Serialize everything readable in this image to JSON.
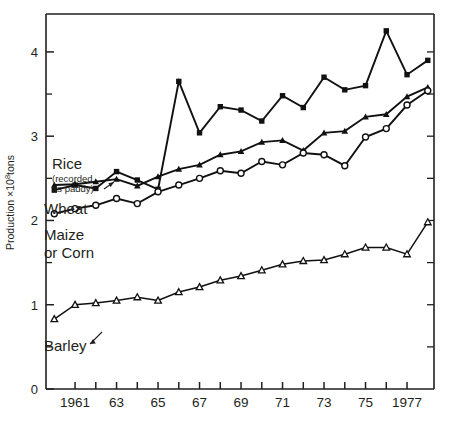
{
  "chart_data": {
    "type": "line",
    "title": "",
    "subtitle": "",
    "xlabel": "",
    "ylabel": "Production ×10⁸tons",
    "ylabel_parts": {
      "pre": "Production ×10",
      "sup": "8",
      "post": "tons"
    },
    "xlim": [
      1959.6,
      1978.3
    ],
    "ylim": [
      0,
      4.45
    ],
    "grid": false,
    "legend_position": "inline-annotations",
    "yticks_major": [
      0,
      1,
      2,
      3,
      4
    ],
    "yticks_major_labels": [
      "0",
      "1",
      "2",
      "3",
      "4"
    ],
    "yticks_minor": [
      0.5,
      1.5,
      2.5,
      3.5
    ],
    "xticks": [
      1961,
      1962,
      1963,
      1964,
      1965,
      1966,
      1967,
      1968,
      1969,
      1970,
      1971,
      1972,
      1973,
      1974,
      1975,
      1976,
      1977
    ],
    "xtick_labels": [
      {
        "x": 1961,
        "label": "1961"
      },
      {
        "x": 1963,
        "label": "63"
      },
      {
        "x": 1965,
        "label": "65"
      },
      {
        "x": 1967,
        "label": "67"
      },
      {
        "x": 1969,
        "label": "69"
      },
      {
        "x": 1971,
        "label": "71"
      },
      {
        "x": 1973,
        "label": "73"
      },
      {
        "x": 1975,
        "label": "75"
      },
      {
        "x": 1977,
        "label": "1977"
      }
    ],
    "x": [
      1960,
      1961,
      1962,
      1963,
      1964,
      1965,
      1966,
      1967,
      1968,
      1969,
      1970,
      1971,
      1972,
      1973,
      1974,
      1975,
      1976,
      1977,
      1978
    ],
    "series": [
      {
        "name": "Wheat",
        "marker": "filled-square",
        "values": [
          2.36,
          2.42,
          2.38,
          2.58,
          2.48,
          2.37,
          3.65,
          3.04,
          3.35,
          3.31,
          3.18,
          3.48,
          3.34,
          3.7,
          3.55,
          3.6,
          4.25,
          3.73,
          3.9
        ]
      },
      {
        "name": "Rice",
        "label": "Rice",
        "sublabel": "(recorded as paddy)",
        "marker": "filled-triangle",
        "values": [
          2.42,
          2.43,
          2.46,
          2.49,
          2.41,
          2.52,
          2.61,
          2.66,
          2.78,
          2.82,
          2.93,
          2.95,
          2.83,
          3.04,
          3.06,
          3.23,
          3.26,
          3.47,
          3.58
        ]
      },
      {
        "name": "Maize or Corn",
        "marker": "open-circle",
        "values": [
          2.08,
          2.14,
          2.18,
          2.26,
          2.2,
          2.34,
          2.42,
          2.5,
          2.59,
          2.56,
          2.7,
          2.66,
          2.8,
          2.78,
          2.65,
          2.99,
          3.09,
          3.37,
          3.54
        ]
      },
      {
        "name": "Barley",
        "marker": "open-triangle",
        "values": [
          0.83,
          1.0,
          1.02,
          1.05,
          1.09,
          1.05,
          1.15,
          1.21,
          1.29,
          1.34,
          1.41,
          1.48,
          1.52,
          1.53,
          1.6,
          1.68,
          1.68,
          1.6,
          1.98
        ]
      }
    ],
    "annotations": [
      {
        "name": "rice-label",
        "text": "Rice"
      },
      {
        "name": "rice-sublabel-line1",
        "text": "(recorded"
      },
      {
        "name": "rice-sublabel-line2",
        "text": "as paddy)"
      },
      {
        "name": "wheat-label",
        "text": "Wheat"
      },
      {
        "name": "maize-label-line1",
        "text": "Maize"
      },
      {
        "name": "maize-label-line2",
        "text": "or Corn"
      },
      {
        "name": "barley-label",
        "text": "Barley"
      }
    ],
    "colors": {
      "ink": "#111111",
      "axis": "#231f20",
      "background": "#ffffff"
    }
  }
}
